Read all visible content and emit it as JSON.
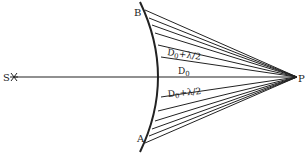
{
  "diagram": {
    "point_labels": {
      "source": "S",
      "observer": "P",
      "top": "B",
      "bottom": "A"
    },
    "distance_labels": {
      "center": "D",
      "center_sub": "0",
      "upper": "D",
      "upper_sub": "0",
      "upper_suffix": "+λ/2",
      "lower": "D",
      "lower_sub": "0",
      "lower_suffix": "+λ/2"
    },
    "colors": {
      "ink": "#222222",
      "background": "#ffffff"
    }
  }
}
